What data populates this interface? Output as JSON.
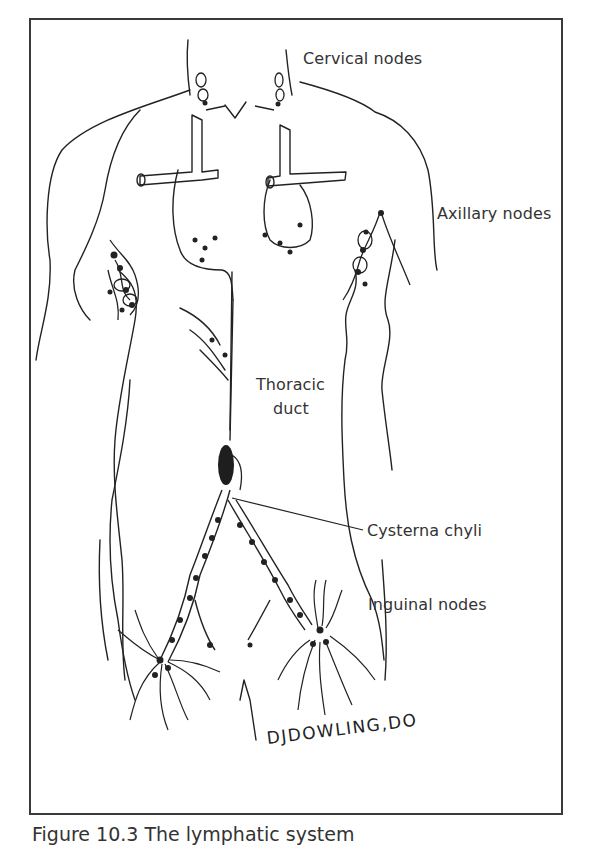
{
  "figure": {
    "labels": {
      "cervical": "Cervical nodes",
      "axillary": "Axillary nodes",
      "thoracic_line1": "Thoracic",
      "thoracic_line2": "duct",
      "cysterna": "Cysterna chyli",
      "inguinal": "Inguinal nodes"
    },
    "signature": "DJDOWLING,DO",
    "caption": "Figure 10.3  The lymphatic system"
  },
  "colors": {
    "ink": "#222222",
    "frame": "#3a3a3a",
    "background": "#ffffff"
  }
}
